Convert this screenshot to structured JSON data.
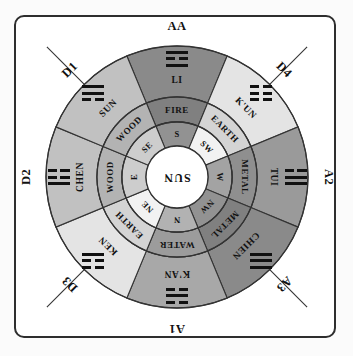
{
  "diagram": {
    "center": {
      "label": "SUN",
      "rotation": 180
    },
    "colors": {
      "frame": "#2e2e2e",
      "stroke": "#333333",
      "background": "#ffffff",
      "dark_gray": "#8a8a8a",
      "mid_gray": "#a8a8a8",
      "light_gray": "#c9c9c9",
      "pale_gray": "#e4e4e4",
      "center_fill": "#ffffff"
    },
    "sectors": [
      {
        "corner_label": "AA",
        "trigram_name": "LI",
        "trigram_lines": [
          "solid",
          "broken",
          "solid"
        ],
        "element": "FIRE",
        "direction": "S",
        "angle": 0,
        "fill": "#8a8a8a"
      },
      {
        "corner_label": "D4",
        "trigram_name": "K'UN",
        "trigram_lines": [
          "broken",
          "broken",
          "broken"
        ],
        "element": "EARTH",
        "direction": "SW",
        "angle": 45,
        "fill": "#e4e4e4"
      },
      {
        "corner_label": "A2",
        "trigram_name": "TUI",
        "trigram_lines": [
          "broken",
          "solid",
          "solid"
        ],
        "element": "METAL",
        "direction": "W",
        "angle": 90,
        "fill": "#9a9a9a"
      },
      {
        "corner_label": "A3",
        "trigram_name": "CHIEN",
        "trigram_lines": [
          "solid",
          "solid",
          "solid"
        ],
        "element": "METAL",
        "direction": "NW",
        "angle": 135,
        "fill": "#8a8a8a"
      },
      {
        "corner_label": "A1",
        "trigram_name": "K'AN",
        "trigram_lines": [
          "broken",
          "solid",
          "broken"
        ],
        "element": "WATER",
        "direction": "N",
        "angle": 180,
        "fill": "#a8a8a8"
      },
      {
        "corner_label": "D3",
        "trigram_name": "KEN",
        "trigram_lines": [
          "solid",
          "broken",
          "broken"
        ],
        "element": "EARTH",
        "direction": "NE",
        "angle": 225,
        "fill": "#e4e4e4"
      },
      {
        "corner_label": "D2",
        "trigram_name": "CHEN",
        "trigram_lines": [
          "broken",
          "broken",
          "solid"
        ],
        "element": "WOOD",
        "direction": "E",
        "angle": 270,
        "fill": "#c1c1c1"
      },
      {
        "corner_label": "D1",
        "trigram_name": "SUN",
        "trigram_lines": [
          "solid",
          "solid",
          "broken"
        ],
        "element": "WOOD",
        "direction": "SE",
        "angle": 315,
        "fill": "#c1c1c1"
      }
    ],
    "geometry": {
      "cx": 177,
      "cy": 177,
      "r_center": 31,
      "r_direction": 55,
      "r_element": 80,
      "r_trigram": 131,
      "r_diagonal": 160
    }
  }
}
